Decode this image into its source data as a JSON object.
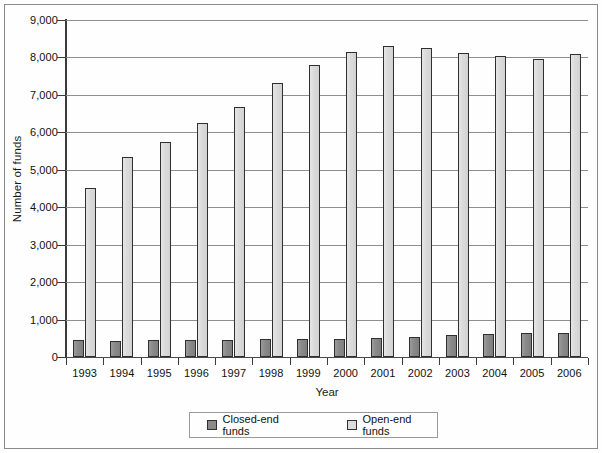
{
  "chart_data": {
    "type": "bar",
    "title": "",
    "xlabel": "Year",
    "ylabel": "Number of funds",
    "categories": [
      "1993",
      "1994",
      "1995",
      "1996",
      "1997",
      "1998",
      "1999",
      "2000",
      "2001",
      "2002",
      "2003",
      "2004",
      "2005",
      "2006"
    ],
    "series": [
      {
        "name": "Closed-end funds",
        "color": "#8a8a8a",
        "values": [
          450,
          430,
          450,
          460,
          460,
          470,
          490,
          470,
          510,
          540,
          580,
          620,
          630,
          650
        ]
      },
      {
        "name": "Open-end funds",
        "color": "#dcdcdc",
        "values": [
          4520,
          5330,
          5730,
          6250,
          6670,
          7310,
          7790,
          8150,
          8300,
          8250,
          8120,
          8050,
          7970,
          8100
        ]
      }
    ],
    "ylim": [
      0,
      9000
    ],
    "y_ticks": [
      0,
      1000,
      2000,
      3000,
      4000,
      5000,
      6000,
      7000,
      8000,
      9000
    ],
    "y_tick_labels": [
      "0",
      "1,000",
      "2,000",
      "3,000",
      "4,000",
      "5,000",
      "6,000",
      "7,000",
      "8,000",
      "9,000"
    ],
    "grid": true,
    "legend_position": "bottom"
  },
  "legend": {
    "items": [
      {
        "label": "Closed-end funds",
        "swatch": "closed"
      },
      {
        "label": "Open-end funds",
        "swatch": "open"
      }
    ]
  }
}
